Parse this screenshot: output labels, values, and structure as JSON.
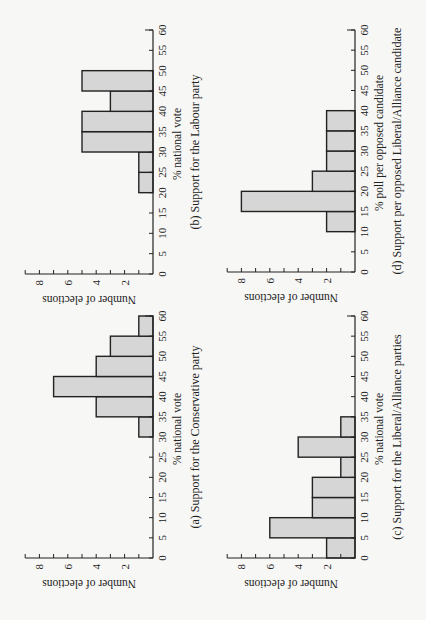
{
  "chart_data": [
    {
      "type": "bar",
      "panel": "a",
      "title": "(a) Support for the Conservative party",
      "xlabel": "% national vote",
      "ylabel": "Number of elections",
      "xlim": [
        0,
        60
      ],
      "ylim": [
        0,
        9
      ],
      "xticks": [
        0,
        5,
        10,
        15,
        20,
        25,
        30,
        35,
        40,
        45,
        50,
        55,
        60
      ],
      "yticks": [
        2,
        4,
        6,
        8
      ],
      "bins": [
        [
          30,
          35
        ],
        [
          35,
          40
        ],
        [
          40,
          45
        ],
        [
          45,
          50
        ],
        [
          50,
          55
        ],
        [
          55,
          60
        ]
      ],
      "values": [
        1,
        4,
        7,
        4,
        3,
        1
      ]
    },
    {
      "type": "bar",
      "panel": "b",
      "title": "(b) Support for the Labour party",
      "xlabel": "% national vote",
      "ylabel": "Number of elections",
      "xlim": [
        0,
        60
      ],
      "ylim": [
        0,
        9
      ],
      "xticks": [
        0,
        5,
        10,
        15,
        20,
        25,
        30,
        35,
        40,
        45,
        50,
        55,
        60
      ],
      "yticks": [
        2,
        4,
        6,
        8
      ],
      "bins": [
        [
          20,
          25
        ],
        [
          25,
          30
        ],
        [
          30,
          35
        ],
        [
          35,
          40
        ],
        [
          40,
          45
        ],
        [
          45,
          50
        ]
      ],
      "values": [
        1,
        1,
        5,
        5,
        3,
        5
      ]
    },
    {
      "type": "bar",
      "panel": "c",
      "title": "(c) Support for the Liberal/Alliance parties",
      "xlabel": "% national vote",
      "ylabel": "Number of elections",
      "xlim": [
        0,
        60
      ],
      "ylim": [
        0,
        9
      ],
      "xticks": [
        0,
        5,
        10,
        15,
        20,
        25,
        30,
        35,
        40,
        45,
        50,
        55,
        60
      ],
      "yticks": [
        2,
        4,
        6,
        8
      ],
      "bins": [
        [
          0,
          5
        ],
        [
          5,
          10
        ],
        [
          10,
          15
        ],
        [
          15,
          20
        ],
        [
          20,
          25
        ],
        [
          25,
          30
        ],
        [
          30,
          35
        ]
      ],
      "values": [
        2,
        6,
        3,
        3,
        1,
        4,
        1
      ]
    },
    {
      "type": "bar",
      "panel": "d",
      "title": "(d) Support per opposed Liberal/Alliance candidate",
      "xlabel": "% poll per opposed candidate",
      "ylabel": "Number of elections",
      "xlim": [
        0,
        60
      ],
      "ylim": [
        0,
        9
      ],
      "xticks": [
        0,
        5,
        10,
        15,
        20,
        25,
        30,
        35,
        40,
        45,
        50,
        55,
        60
      ],
      "yticks": [
        2,
        4,
        6,
        8
      ],
      "bins": [
        [
          10,
          15
        ],
        [
          15,
          20
        ],
        [
          20,
          25
        ],
        [
          25,
          30
        ],
        [
          30,
          35
        ],
        [
          35,
          40
        ]
      ],
      "values": [
        2,
        8,
        3,
        2,
        2,
        2
      ]
    }
  ]
}
